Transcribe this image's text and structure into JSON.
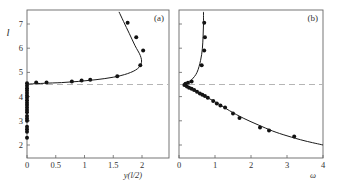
{
  "chart_data": [
    {
      "type": "scatter",
      "panel_label": "(a)",
      "xlabel": "y(l/2)",
      "ylabel": "l",
      "xlim": [
        0,
        2.45
      ],
      "ylim": [
        1.5,
        7.5
      ],
      "xticks": [
        0,
        0.5,
        1,
        1.5,
        2
      ],
      "xtick_labels": [
        "0",
        "0.5",
        "1",
        "1.5",
        "2"
      ],
      "yticks": [
        2,
        3,
        4,
        5,
        6,
        7
      ],
      "ytick_labels": [
        "2",
        "3",
        "4",
        "5",
        "6",
        "7"
      ],
      "grid": false,
      "reference_line": {
        "orientation": "horizontal",
        "y": 4.5,
        "style": "dashed"
      },
      "series": [
        {
          "name": "simulation",
          "kind": "points",
          "points": [
            [
              0,
              2.3
            ],
            [
              0,
              2.55
            ],
            [
              0,
              2.65
            ],
            [
              0,
              2.75
            ],
            [
              0,
              3.0
            ],
            [
              0,
              3.1
            ],
            [
              0,
              3.2
            ],
            [
              0,
              3.35
            ],
            [
              0,
              3.45
            ],
            [
              0,
              3.55
            ],
            [
              0,
              3.65
            ],
            [
              0,
              3.75
            ],
            [
              0,
              3.85
            ],
            [
              0,
              3.95
            ],
            [
              0,
              4.05
            ],
            [
              0,
              4.15
            ],
            [
              0,
              4.25
            ],
            [
              0,
              4.35
            ],
            [
              0,
              4.45
            ],
            [
              0,
              4.55
            ],
            [
              0.16,
              4.58
            ],
            [
              0.34,
              4.58
            ],
            [
              0.78,
              4.62
            ],
            [
              0.95,
              4.67
            ],
            [
              1.1,
              4.7
            ],
            [
              1.57,
              4.84
            ],
            [
              1.97,
              5.3
            ],
            [
              2.02,
              5.9
            ],
            [
              1.9,
              6.45
            ],
            [
              1.75,
              7.05
            ]
          ]
        },
        {
          "name": "theory",
          "kind": "line",
          "points": [
            [
              0,
              4.5
            ],
            [
              0.05,
              4.52
            ],
            [
              0.3,
              4.55
            ],
            [
              0.6,
              4.58
            ],
            [
              0.9,
              4.63
            ],
            [
              1.2,
              4.7
            ],
            [
              1.5,
              4.8
            ],
            [
              1.75,
              4.95
            ],
            [
              1.92,
              5.15
            ],
            [
              1.99,
              5.4
            ],
            [
              1.97,
              5.7
            ],
            [
              1.88,
              6.1
            ],
            [
              1.78,
              6.6
            ],
            [
              1.68,
              7.1
            ],
            [
              1.6,
              7.5
            ]
          ]
        }
      ]
    },
    {
      "type": "scatter",
      "panel_label": "(b)",
      "xlabel": "ω",
      "ylabel": "",
      "xlim": [
        0,
        4
      ],
      "ylim": [
        1.5,
        7.5
      ],
      "xticks": [
        0,
        1,
        2,
        3,
        4
      ],
      "xtick_labels": [
        "0",
        "1",
        "2",
        "3",
        "4"
      ],
      "grid": false,
      "reference_line": {
        "orientation": "horizontal",
        "y": 4.5,
        "style": "dashed"
      },
      "series": [
        {
          "name": "simulation",
          "kind": "points",
          "points": [
            [
              0.7,
              7.05
            ],
            [
              0.72,
              6.45
            ],
            [
              0.7,
              5.9
            ],
            [
              0.63,
              5.3
            ],
            [
              0.35,
              4.62
            ],
            [
              0.25,
              4.57
            ],
            [
              0.18,
              4.53
            ],
            [
              0.15,
              4.48
            ],
            [
              0.22,
              4.42
            ],
            [
              0.28,
              4.37
            ],
            [
              0.35,
              4.32
            ],
            [
              0.42,
              4.27
            ],
            [
              0.5,
              4.2
            ],
            [
              0.58,
              4.13
            ],
            [
              0.65,
              4.08
            ],
            [
              0.72,
              4.02
            ],
            [
              0.8,
              3.95
            ],
            [
              0.95,
              3.82
            ],
            [
              1.05,
              3.72
            ],
            [
              1.15,
              3.63
            ],
            [
              1.28,
              3.55
            ],
            [
              1.5,
              3.3
            ],
            [
              1.68,
              3.12
            ],
            [
              2.25,
              2.72
            ],
            [
              2.5,
              2.6
            ],
            [
              3.2,
              2.35
            ]
          ]
        },
        {
          "name": "theory",
          "kind": "line",
          "points": [
            [
              0.68,
              7.5
            ],
            [
              0.68,
              7.0
            ],
            [
              0.67,
              6.5
            ],
            [
              0.65,
              6.0
            ],
            [
              0.6,
              5.5
            ],
            [
              0.5,
              5.0
            ],
            [
              0.35,
              4.7
            ],
            [
              0.15,
              4.5
            ],
            [
              0.3,
              4.35
            ],
            [
              0.55,
              4.15
            ],
            [
              0.8,
              3.95
            ],
            [
              1.1,
              3.7
            ],
            [
              1.4,
              3.42
            ],
            [
              1.8,
              3.1
            ],
            [
              2.2,
              2.83
            ],
            [
              2.6,
              2.58
            ],
            [
              3.0,
              2.38
            ],
            [
              3.5,
              2.17
            ],
            [
              4.0,
              2.0
            ]
          ]
        }
      ]
    }
  ]
}
